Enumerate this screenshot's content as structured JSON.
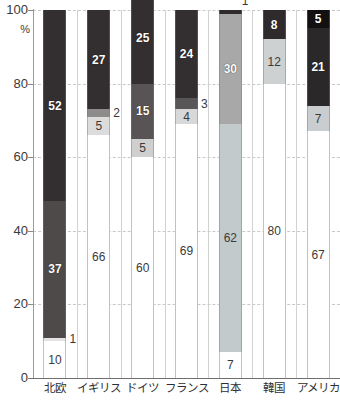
{
  "chart_data": {
    "type": "bar",
    "subtype": "stacked-100-percent",
    "title": "",
    "xlabel": "",
    "ylabel": "%",
    "ylim": [
      0,
      100
    ],
    "yticks": [
      0,
      20,
      40,
      60,
      80,
      100
    ],
    "ytick_labels": [
      "0",
      "20",
      "40",
      "60",
      "80",
      "100"
    ],
    "grid": "horizontal-dashed",
    "legend": "none",
    "categories": [
      "北欧",
      "イギリス",
      "ドイツ",
      "フランス",
      "日本",
      "韓国",
      "アメリカ"
    ],
    "series": [
      {
        "name": "segment-1-bottom",
        "values": [
          10,
          66,
          60,
          69,
          7,
          80,
          67
        ]
      },
      {
        "name": "segment-2",
        "values": [
          1,
          5,
          5,
          4,
          62,
          12,
          7
        ]
      },
      {
        "name": "segment-3",
        "values": [
          37,
          2,
          15,
          3,
          30,
          8,
          21
        ]
      },
      {
        "name": "segment-4-top",
        "values": [
          52,
          27,
          25,
          24,
          1,
          null,
          5
        ]
      }
    ],
    "bars": [
      {
        "category": "北欧",
        "segments": [
          {
            "value": 10,
            "label": "10",
            "color": "#ffffff",
            "text_style": "dark-on-light",
            "label_position": "inside"
          },
          {
            "value": 1,
            "label": "1",
            "color": "#e3e3e3",
            "text_style": "dark-on-light",
            "label_position": "outside-right"
          },
          {
            "value": 37,
            "label": "37",
            "color": "#4e4a4a",
            "text_style": "light-on-dark",
            "label_position": "inside"
          },
          {
            "value": 52,
            "label": "52",
            "color": "#332f30",
            "text_style": "light-on-dark",
            "label_position": "inside"
          }
        ]
      },
      {
        "category": "イギリス",
        "segments": [
          {
            "value": 66,
            "label": "66",
            "color": "#ffffff",
            "text_style": "dark-on-light",
            "label_position": "inside"
          },
          {
            "value": 5,
            "label": "5",
            "color": "#dcdcdc",
            "text_style": "dark-on-light",
            "label_position": "inside"
          },
          {
            "value": 2,
            "label": "2",
            "color": "#8e8b8b",
            "text_style": "dark-on-light",
            "label_position": "outside-right"
          },
          {
            "value": 27,
            "label": "27",
            "color": "#332f30",
            "text_style": "light-on-dark",
            "label_position": "inside"
          }
        ]
      },
      {
        "category": "ドイツ",
        "segments": [
          {
            "value": 60,
            "label": "60",
            "color": "#ffffff",
            "text_style": "dark-on-light",
            "label_position": "inside"
          },
          {
            "value": 5,
            "label": "5",
            "color": "#cfcfcf",
            "text_style": "dark-on-light",
            "label_position": "inside"
          },
          {
            "value": 15,
            "label": "15",
            "color": "#585455",
            "text_style": "light-on-dark",
            "label_position": "inside"
          },
          {
            "value": 25,
            "label": "25",
            "color": "#332f30",
            "text_style": "light-on-dark",
            "label_position": "inside"
          }
        ]
      },
      {
        "category": "フランス",
        "segments": [
          {
            "value": 69,
            "label": "69",
            "color": "#ffffff",
            "text_style": "dark-on-light",
            "label_position": "inside"
          },
          {
            "value": 4,
            "label": "4",
            "color": "#d8d8d8",
            "text_style": "dark-on-light",
            "label_position": "inside"
          },
          {
            "value": 3,
            "label": "3",
            "color": "#595657",
            "text_style": "dark-on-light",
            "label_position": "outside-right"
          },
          {
            "value": 24,
            "label": "24",
            "color": "#332f30",
            "text_style": "light-on-dark",
            "label_position": "inside"
          }
        ]
      },
      {
        "category": "日本",
        "segments": [
          {
            "value": 7,
            "label": "7",
            "color": "#ffffff",
            "text_style": "dark-on-light",
            "label_position": "inside"
          },
          {
            "value": 62,
            "label": "62",
            "color": "#c3cacc",
            "text_style": "dark-on-light",
            "label_position": "inside"
          },
          {
            "value": 30,
            "label": "30",
            "color": "#a8a8a8",
            "text_style": "light-on-dark",
            "label_position": "inside"
          },
          {
            "value": 1,
            "label": "1",
            "color": "#2f2b2c",
            "text_style": "dark-on-light",
            "label_position": "outside-top"
          }
        ]
      },
      {
        "category": "韓国",
        "segments": [
          {
            "value": 80,
            "label": "80",
            "color": "#ffffff",
            "text_style": "dark-on-light",
            "label_position": "inside"
          },
          {
            "value": 12,
            "label": "12",
            "color": "#cdd1d2",
            "text_style": "dark-on-light",
            "label_position": "inside"
          },
          {
            "value": 8,
            "label": "8",
            "color": "#2f2b2c",
            "text_style": "light-on-dark",
            "label_position": "inside"
          }
        ]
      },
      {
        "category": "アメリカ",
        "segments": [
          {
            "value": 67,
            "label": "67",
            "color": "#ffffff",
            "text_style": "dark-on-light",
            "label_position": "inside"
          },
          {
            "value": 7,
            "label": "7",
            "color": "#c9cdcf",
            "text_style": "dark-on-light",
            "label_position": "inside"
          },
          {
            "value": 21,
            "label": "21",
            "color": "#2b2829",
            "text_style": "light-on-dark",
            "label_position": "inside"
          },
          {
            "value": 5,
            "label": "5",
            "color": "#121011",
            "text_style": "light-on-dark",
            "label_position": "inside"
          }
        ]
      }
    ]
  },
  "axis": {
    "unit_label": "%",
    "top_label": "100"
  }
}
